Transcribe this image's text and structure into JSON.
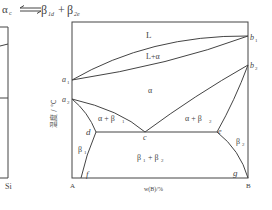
{
  "reaction": {
    "lhs": "α",
    "lhs_sub": "c",
    "arrow": "⇌",
    "rhs1": "β",
    "rhs1_sub": "1d",
    "plus": "+",
    "rhs2": "β",
    "rhs2_sub": "2e"
  },
  "left_fragment": {
    "label": "Si"
  },
  "diagram": {
    "y_axis_label": "温度 / ℃",
    "x_axis_label": "w(B)/%",
    "corner_left": "A",
    "corner_right": "B",
    "points": {
      "a1": {
        "name": "a",
        "sub": "1"
      },
      "a2": {
        "name": "a",
        "sub": "2"
      },
      "b1": {
        "name": "b",
        "sub": "1"
      },
      "b2": {
        "name": "b",
        "sub": "2"
      },
      "c": "c",
      "d": "d",
      "e": "e",
      "f": "f",
      "g": "g"
    },
    "regions": {
      "liquid": "L",
      "liquid_alpha": "L+α",
      "alpha": "α",
      "alpha_beta1": "α + β",
      "alpha_beta1_sub": "1",
      "alpha_beta2": "α + β",
      "alpha_beta2_sub": "2",
      "beta1": "β",
      "beta1_sub": "1",
      "beta2": "β",
      "beta2_sub": "2",
      "beta1_beta2_a": "β",
      "beta1_beta2_a_sub": "1",
      "beta1_beta2_plus": " + β",
      "beta1_beta2_b_sub": "2"
    }
  },
  "colors": {
    "line": "#444444",
    "text": "#444444",
    "background": "#ffffff"
  }
}
